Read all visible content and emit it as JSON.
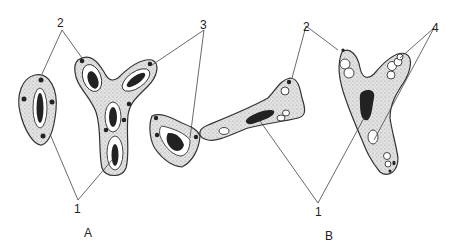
{
  "figure": {
    "panels": [
      {
        "id": "A",
        "label": "A",
        "callouts": [
          {
            "number": "1"
          },
          {
            "number": "2"
          },
          {
            "number": "3"
          }
        ]
      },
      {
        "id": "B",
        "label": "B",
        "callouts": [
          {
            "number": "1"
          },
          {
            "number": "2"
          },
          {
            "number": "4"
          }
        ]
      }
    ],
    "colors": {
      "outline": "#333333",
      "cytoplasm_stipple": "#d9d9d9",
      "nucleus": "#222222",
      "background": "#ffffff"
    }
  }
}
